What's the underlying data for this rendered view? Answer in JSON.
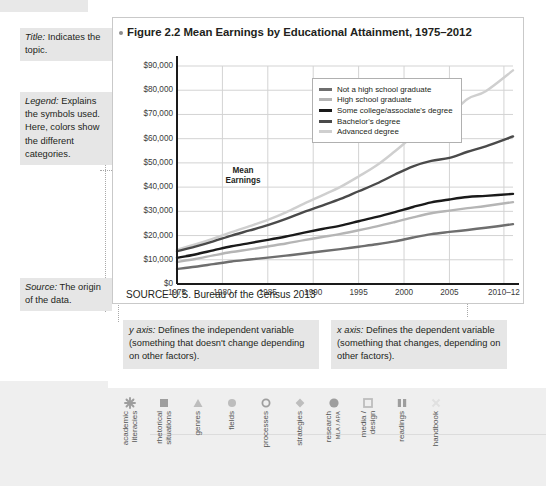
{
  "figure": {
    "title": "Figure 2.2  Mean Earnings by Educational Attainment, 1975–2012",
    "source": "SOURCE  U.S. Bureau of the Census 2013"
  },
  "annotations": {
    "title_note_label": "Title:",
    "title_note_text": " Indicates the topic.",
    "legend_note_label": "Legend:",
    "legend_note_text": " Explains the symbols used. Here, colors show the different categories.",
    "source_note_label": "Source:",
    "source_note_text": " The origin of the data.",
    "y_axis_box_label": "y axis:",
    "y_axis_box_text": " Defines the independent variable (something that doesn't change depending on other factors).",
    "x_axis_box_label": "x axis:",
    "x_axis_box_text": " Defines the dependent variable (something that changes, depending on other factors)."
  },
  "chart_data": {
    "type": "line",
    "title": "Figure 2.2  Mean Earnings by Educational Attainment, 1975–2012",
    "xlabel": "",
    "ylabel": "Mean Earnings",
    "ylim": [
      0,
      90000
    ],
    "grid": true,
    "legend_position": "upper-left-inside",
    "y_ticks": [
      "$0",
      "$10,000",
      "$20,000",
      "$30,000",
      "$40,000",
      "$50,000",
      "$60,000",
      "$70,000",
      "$80,000",
      "$90,000"
    ],
    "y_tick_values": [
      0,
      10000,
      20000,
      30000,
      40000,
      50000,
      60000,
      70000,
      80000,
      90000
    ],
    "x_ticks": [
      "1975",
      "1980",
      "1985",
      "1990",
      "1995",
      "2000",
      "2005",
      "2010–12"
    ],
    "x": [
      1975,
      1977,
      1979,
      1981,
      1983,
      1985,
      1987,
      1989,
      1991,
      1993,
      1995,
      1997,
      1999,
      2001,
      2003,
      2005,
      2007,
      2009,
      2012
    ],
    "series": [
      {
        "name": "Not a high school graduate",
        "color": "#6e6e6e",
        "values": [
          6200,
          7100,
          8200,
          9300,
          10100,
          10900,
          11700,
          12600,
          13500,
          14400,
          15400,
          16400,
          17600,
          19200,
          20600,
          21500,
          22300,
          23200,
          24700
        ]
      },
      {
        "name": "High school graduate",
        "color": "#b5b5b5",
        "values": [
          9100,
          10300,
          11800,
          13200,
          14300,
          15500,
          16700,
          18100,
          19400,
          20700,
          22200,
          23800,
          25600,
          27500,
          29200,
          30300,
          31300,
          32200,
          33800
        ]
      },
      {
        "name": "Some college/associate's degree",
        "color": "#1a1a1a",
        "values": [
          10800,
          12200,
          13900,
          15600,
          16900,
          18200,
          19600,
          21200,
          22700,
          24100,
          25900,
          27700,
          29700,
          31800,
          33700,
          34900,
          35900,
          36400,
          37200
        ]
      },
      {
        "name": "Bachelor's degree",
        "color": "#4a4a4a",
        "values": [
          13500,
          15400,
          17600,
          20000,
          22100,
          24300,
          26900,
          29800,
          32400,
          35100,
          38300,
          41500,
          45200,
          48600,
          50800,
          52100,
          54600,
          56800,
          60900
        ]
      },
      {
        "name": "Advanced degree",
        "color": "#cfcfcf",
        "values": [
          14200,
          16300,
          18700,
          21400,
          23900,
          26500,
          29600,
          33200,
          36600,
          40100,
          44400,
          49000,
          54800,
          60900,
          65300,
          69700,
          76400,
          79600,
          88200
        ]
      }
    ]
  },
  "nav": {
    "items": [
      {
        "label": "academic\nliteracies",
        "icon": "asterisk-icon"
      },
      {
        "label": "rhetorical\nsituations",
        "icon": "filled-square-icon"
      },
      {
        "label": "genres",
        "icon": "triangle-icon"
      },
      {
        "label": "fields",
        "icon": "filled-circle-icon"
      },
      {
        "label": "processes",
        "icon": "hollow-circle-icon"
      },
      {
        "label": "strategies",
        "icon": "diamond-icon"
      },
      {
        "label": "research",
        "sub": "MLA / APA",
        "icon": "large-circle-icon"
      },
      {
        "label": "media /\ndesign",
        "icon": "hollow-square-icon"
      },
      {
        "label": "readings",
        "icon": "book-icon"
      },
      {
        "label": "handbook",
        "icon": "faded-x-icon"
      }
    ]
  }
}
